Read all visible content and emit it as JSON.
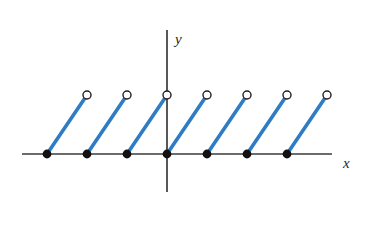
{
  "figure": {
    "width": 366,
    "height": 230,
    "background_color": "#ffffff"
  },
  "axes": {
    "x_axis": {
      "label": "x",
      "color": "#3a3a3a",
      "y_pixel": 154,
      "x_start_pixel": 22,
      "x_end_pixel": 332,
      "label_x_pixel": 343,
      "label_y_pixel": 168
    },
    "y_axis": {
      "label": "y",
      "color": "#3a3a3a",
      "x_pixel": 167,
      "y_top_pixel": 30,
      "y_bottom_pixel": 192,
      "label_x_pixel": 175,
      "label_y_pixel": 44
    },
    "origin_pixel": [
      167,
      154
    ]
  },
  "style": {
    "segment_color": "#2E7DC4",
    "segment_width": 3.6,
    "closed_dot_color": "#111111",
    "closed_dot_radius": 4.4,
    "open_dot_stroke": "#231f20",
    "open_dot_fill": "#ffffff",
    "open_dot_radius": 4.0,
    "open_dot_stroke_width": 1.4,
    "axis_width": 1.7
  },
  "chart_data": {
    "type": "line",
    "title": "",
    "subtitle": "",
    "xlabel": "x",
    "ylabel": "y",
    "grid": false,
    "legend": "none",
    "period_pixels": 40,
    "rise_pixels": 59,
    "xlim_pixels": [
      22,
      332
    ],
    "ylim_pixels": [
      192,
      30
    ],
    "series": [
      {
        "name": "sawtooth",
        "segments": [
          {
            "index": 1,
            "closed_endpoint_pixel": [
              47,
              154
            ],
            "open_endpoint_pixel": [
              87,
              95
            ]
          },
          {
            "index": 2,
            "closed_endpoint_pixel": [
              87,
              154
            ],
            "open_endpoint_pixel": [
              127,
              95
            ]
          },
          {
            "index": 3,
            "closed_endpoint_pixel": [
              127,
              154
            ],
            "open_endpoint_pixel": [
              167,
              95
            ]
          },
          {
            "index": 4,
            "closed_endpoint_pixel": [
              167,
              154
            ],
            "open_endpoint_pixel": [
              207,
              95
            ]
          },
          {
            "index": 5,
            "closed_endpoint_pixel": [
              207,
              154
            ],
            "open_endpoint_pixel": [
              247,
              95
            ]
          },
          {
            "index": 6,
            "closed_endpoint_pixel": [
              247,
              154
            ],
            "open_endpoint_pixel": [
              287,
              95
            ]
          },
          {
            "index": 7,
            "closed_endpoint_pixel": [
              287,
              154
            ],
            "open_endpoint_pixel": [
              327,
              95
            ]
          }
        ]
      }
    ],
    "closed_points_x_pixels": [
      47,
      87,
      127,
      167,
      207,
      247,
      287
    ],
    "closed_points_y_pixel": 154,
    "open_points_x_pixels": [
      87,
      127,
      167,
      207,
      247,
      287,
      327
    ],
    "open_points_y_pixel": 95
  }
}
